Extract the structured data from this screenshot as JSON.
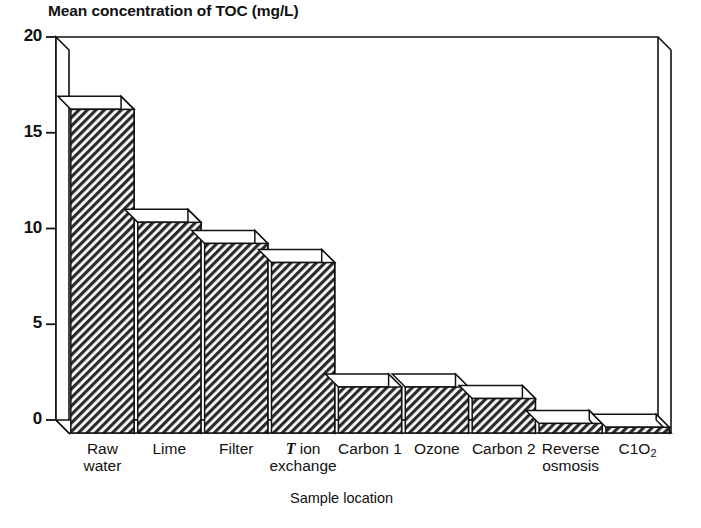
{
  "chart_data": {
    "type": "bar",
    "title": "Mean concentration of TOC (mg/L)",
    "xlabel": "Sample location",
    "ylabel": "",
    "ylim": [
      0,
      20
    ],
    "yticks": [
      0,
      5,
      10,
      15,
      20
    ],
    "ytick_labels": [
      "0",
      "5",
      "10",
      "15",
      "20"
    ],
    "grid": false,
    "legend": "none",
    "style": "3d-extruded-hatched-bars",
    "categories": [
      "Raw\nwater",
      "Lime",
      "Filter",
      "T ion\nexchange",
      "Carbon 1",
      "Ozone",
      "Carbon 2",
      "Reverse\nosmosis",
      "ClO2"
    ],
    "category_labels": [
      {
        "line1": "Raw",
        "line2": "water",
        "italic_prefix": ""
      },
      {
        "line1": "Lime",
        "line2": "",
        "italic_prefix": ""
      },
      {
        "line1": "Filter",
        "line2": "",
        "italic_prefix": ""
      },
      {
        "line1": "ion",
        "line2": "exchange",
        "italic_prefix": "T"
      },
      {
        "line1": "Carbon 1",
        "line2": "",
        "italic_prefix": ""
      },
      {
        "line1": "Ozone",
        "line2": "",
        "italic_prefix": ""
      },
      {
        "line1": "Carbon 2",
        "line2": "",
        "italic_prefix": ""
      },
      {
        "line1": "Reverse",
        "line2": "osmosis",
        "italic_prefix": ""
      },
      {
        "line1": "C1O",
        "line2": "",
        "subscript": "2",
        "italic_prefix": ""
      }
    ],
    "values": [
      16.9,
      11.0,
      9.9,
      8.9,
      2.4,
      2.4,
      1.8,
      0.5,
      0.3
    ]
  },
  "colors": {
    "ink": "#111111",
    "bar_fill": "#4a4a4a",
    "bar_top": "#ffffff",
    "background": "#ffffff"
  }
}
